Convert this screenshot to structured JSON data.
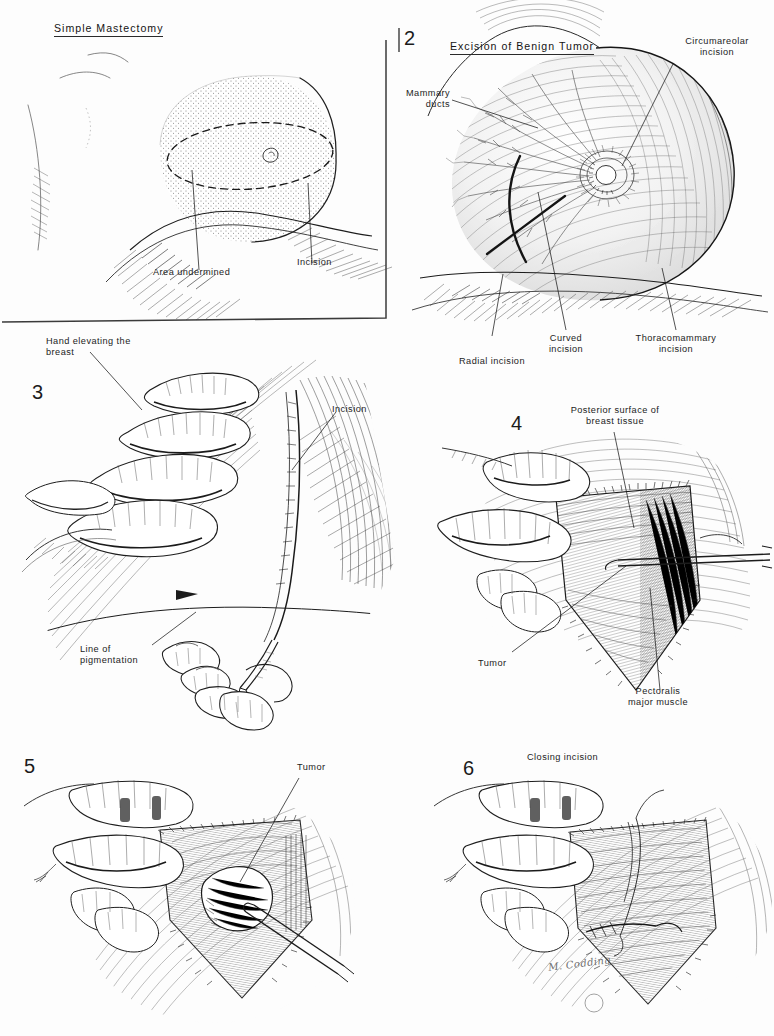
{
  "plate": {
    "background_color": "#fdfdfd",
    "ink_color": "#1a1a1a",
    "signature": "M. Codding"
  },
  "panels": [
    {
      "number": "",
      "title": "Simple Mastectomy",
      "labels": [
        {
          "text": "Area undermined"
        },
        {
          "text": "Incision"
        }
      ]
    },
    {
      "number": "2",
      "title": "Excision of Benign Tumor",
      "labels": [
        {
          "text": "Circumareolar\nincision"
        },
        {
          "text": "Mammary\nducts"
        },
        {
          "text": "Radial incision"
        },
        {
          "text": "Curved\nincision"
        },
        {
          "text": "Thoracomammary\nincision"
        }
      ]
    },
    {
      "number": "3",
      "title": "",
      "labels": [
        {
          "text": "Hand elevating the\nbreast"
        },
        {
          "text": "Incision"
        },
        {
          "text": "Line of\npigmentation"
        }
      ]
    },
    {
      "number": "4",
      "title": "",
      "labels": [
        {
          "text": "Posterior surface of\nbreast tissue"
        },
        {
          "text": "Tumor"
        },
        {
          "text": "Pectoralis\nmajor muscle"
        }
      ]
    },
    {
      "number": "5",
      "title": "",
      "labels": [
        {
          "text": "Tumor"
        }
      ]
    },
    {
      "number": "6",
      "title": "Closing incision",
      "labels": []
    }
  ],
  "p1": {
    "title": "Simple Mastectomy",
    "area_undermined": "Area undermined",
    "incision": "Incision"
  },
  "p2": {
    "num": "2",
    "title": "Excision of Benign Tumor",
    "circumareolar": "Circumareolar\nincision",
    "mammary_ducts": "Mammary\nducts",
    "radial": "Radial incision",
    "curved": "Curved\nincision",
    "thoracomammary": "Thoracomammary\nincision"
  },
  "p3": {
    "num": "3",
    "hand": "Hand elevating the\nbreast",
    "incision": "Incision",
    "pigmentation": "Line of\npigmentation"
  },
  "p4": {
    "num": "4",
    "posterior": "Posterior surface of\nbreast tissue",
    "tumor": "Tumor",
    "pectoralis": "Pectoralis\nmajor muscle"
  },
  "p5": {
    "num": "5",
    "tumor": "Tumor"
  },
  "p6": {
    "num": "6",
    "title": "Closing incision"
  },
  "signature": {
    "text": "M. Codding"
  }
}
